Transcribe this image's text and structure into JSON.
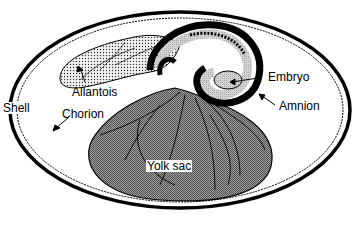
{
  "diagram": {
    "labels": {
      "allantois": "Allantois",
      "embryo": "Embryo",
      "amnion": "Amnion",
      "shell": "Shell",
      "chorion": "Chorion",
      "yolk_sac": "Yolk sac"
    },
    "colors": {
      "outline": "#000000",
      "yolk_fill": "#8a8a8a",
      "allantois_fill": "#e6e6e6",
      "embryo_fill": "#c8c8c8",
      "background": "#ffffff"
    }
  }
}
